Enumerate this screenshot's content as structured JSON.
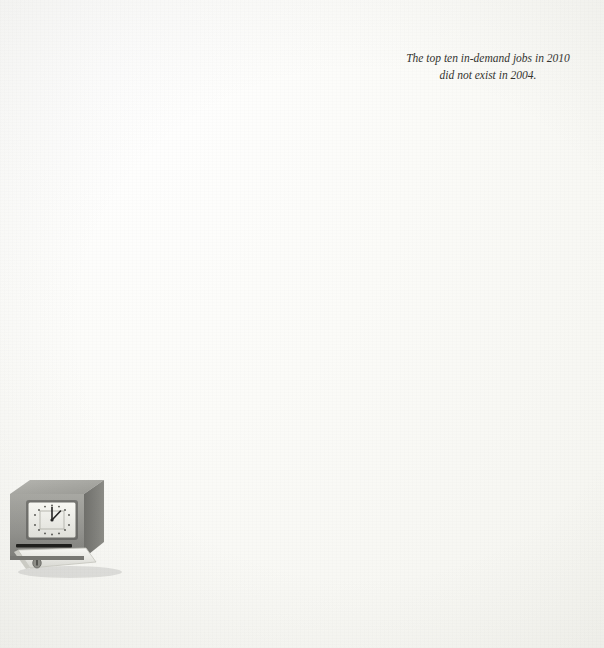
{
  "annotation": {
    "line1": "The top ten in-demand jobs in 2010",
    "line2": "did not exist in 2004."
  },
  "illustration": {
    "name": "punch-time-clock",
    "clock_hour_hand": "12",
    "clock_minute_hand": "2"
  },
  "axis": {
    "ticks": [
      "2,000",
      "1,500",
      "1,000",
      "500"
    ],
    "tick_values": [
      2000,
      1500,
      1000,
      500
    ]
  },
  "colors": {
    "bar_dark": "#8b8b87",
    "bar_light": "#dcdcd8",
    "gridline": "#bdbdb8",
    "baseline": "#cfcfcb",
    "text": "#232321",
    "background": "#fbfbf8"
  },
  "chart_data": {
    "type": "bar",
    "title": "",
    "subtitle": "",
    "xlabel": "",
    "ylabel": "",
    "ylim": [
      0,
      2300
    ],
    "grid": true,
    "legend": null,
    "annotations": [
      "The top ten in-demand jobs in 2010 did not exist in 2004."
    ],
    "categories": [
      "Korea",
      "Greece",
      "Poland",
      "Israel",
      "Italy",
      "United States",
      "Japan",
      "New Zealand",
      "Australia",
      "Canada",
      "United Kingdom",
      "Spain",
      "Ireland",
      "Belgium",
      "France",
      "Germany",
      "Netherlands"
    ],
    "values": [
      2256,
      2120,
      1969,
      1898,
      1802,
      1792,
      1772,
      1753,
      1732,
      1727,
      1653,
      1647,
      1601,
      1568,
      1544,
      1430,
      1389
    ],
    "value_labels": [
      "2,256",
      "2,120",
      "1,969",
      "1,898",
      "1,802",
      "1,792",
      "1,772",
      "1,753",
      "1,732",
      "1,727",
      "1,653",
      "1,647",
      "1,601",
      "1,568",
      "1,544",
      "1,430",
      "1,389"
    ]
  }
}
